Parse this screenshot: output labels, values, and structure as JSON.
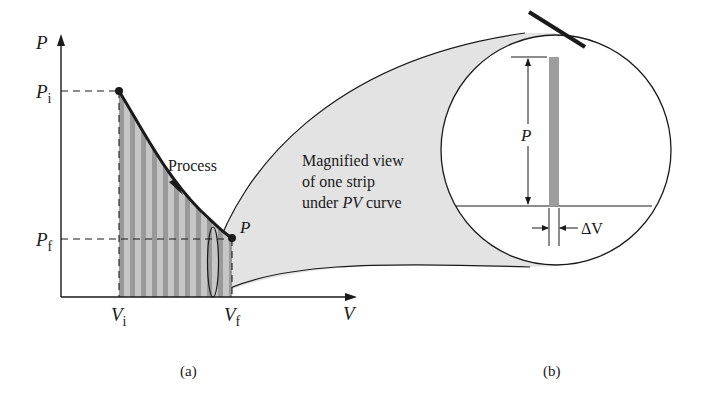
{
  "panel_a": {
    "y_axis_label": "P",
    "x_axis_label": "V",
    "p_initial": {
      "base": "P",
      "sub": "i"
    },
    "p_final": {
      "base": "P",
      "sub": "f"
    },
    "v_initial": {
      "base": "V",
      "sub": "i"
    },
    "v_final": {
      "base": "V",
      "sub": "f"
    },
    "process_label": "Process",
    "end_point_label": "P",
    "caption": "(a)"
  },
  "panel_b": {
    "description_lines": [
      "Magnified view",
      "of one strip",
      "under PV curve"
    ],
    "line3_prefix": "under ",
    "line3_italic": "PV",
    "line3_suffix": " curve",
    "height_label": "P",
    "width_label": "ΔV",
    "caption": "(b)"
  },
  "colors": {
    "stroke": "#1a1a1a",
    "strip_dark": "#9a9a9a",
    "strip_light": "#c4c4c4",
    "magnifier_fill": "#e2e2e2",
    "strip_b": "#9d9d9d"
  }
}
